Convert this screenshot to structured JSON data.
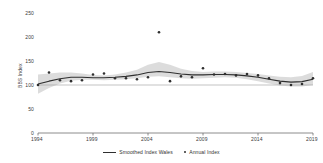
{
  "chart_data": {
    "type": "line",
    "title": "",
    "xlabel": "",
    "ylabel": "BBS Index",
    "xlim": [
      1994,
      2019
    ],
    "ylim": [
      0,
      250
    ],
    "grid": false,
    "legend_position": "bottom-center",
    "xticks": [
      1994,
      1999,
      2004,
      2009,
      2014,
      2019
    ],
    "yticks": [
      0,
      50,
      100,
      150,
      200,
      250
    ],
    "x": [
      1994,
      1995,
      1996,
      1997,
      1998,
      1999,
      2000,
      2001,
      2002,
      2003,
      2004,
      2005,
      2006,
      2007,
      2008,
      2009,
      2010,
      2011,
      2012,
      2013,
      2014,
      2015,
      2016,
      2017,
      2018,
      2019
    ],
    "series": [
      {
        "name": "Annual Index",
        "style": "scatter",
        "color": "#2f2f2f",
        "values": [
          100,
          126,
          110,
          108,
          110,
          122,
          124,
          114,
          114,
          112,
          116,
          210,
          108,
          118,
          116,
          135,
          122,
          123,
          120,
          123,
          120,
          114,
          104,
          100,
          102,
          114
        ]
      },
      {
        "name": "Smoothed Index Wales",
        "style": "line",
        "color": "#2f2f2f",
        "values": [
          102,
          108,
          113,
          116,
          116,
          115,
          115,
          116,
          118,
          121,
          126,
          128,
          126,
          123,
          121,
          121,
          122,
          122,
          121,
          119,
          116,
          112,
          108,
          106,
          107,
          112
        ],
        "band_lower": [
          82,
          94,
          103,
          109,
          111,
          111,
          110,
          111,
          112,
          114,
          117,
          118,
          116,
          114,
          113,
          114,
          115,
          116,
          115,
          112,
          108,
          103,
          99,
          97,
          97,
          100
        ],
        "band_upper": [
          122,
          124,
          126,
          126,
          124,
          121,
          120,
          122,
          126,
          132,
          142,
          148,
          142,
          134,
          129,
          127,
          128,
          128,
          127,
          125,
          123,
          120,
          117,
          116,
          119,
          127
        ],
        "band_color": "#d0d0d0"
      }
    ]
  },
  "legend": {
    "items": [
      {
        "label": "Smoothed Index Wales",
        "marker": "line"
      },
      {
        "label": "Annual Index",
        "marker": "dot"
      }
    ]
  }
}
